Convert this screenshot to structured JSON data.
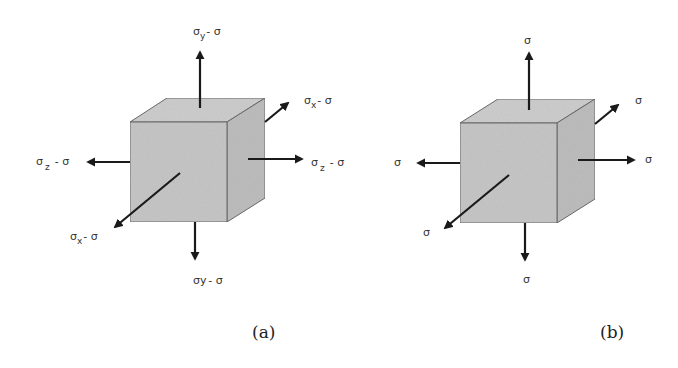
{
  "figure": {
    "colors": {
      "cube_fill": "#c4c4c4",
      "cube_top": "#cfcfcf",
      "cube_side": "#bdbdbd",
      "edge": "#666666",
      "arrow": "#1a1a1a",
      "text": "#333333"
    },
    "panel_a": {
      "caption": "(a)",
      "labels": {
        "top": {
          "base": "σ",
          "sub": "y",
          "rest": "- σ"
        },
        "back_right": {
          "base": "σ",
          "sub": "x",
          "rest": "- σ"
        },
        "left": {
          "base": "σ",
          "sub": "z",
          "rest": "- σ"
        },
        "right": {
          "base": "σ",
          "sub": "z",
          "rest": "- σ"
        },
        "front_left": {
          "base": "σ",
          "sub": "x",
          "rest": "- σ"
        },
        "bottom": {
          "base": "σy",
          "sub": "",
          "rest": "- σ"
        }
      }
    },
    "panel_b": {
      "caption": "(b)",
      "labels": {
        "top": "σ",
        "back_right": "σ",
        "left": "σ",
        "right": "σ",
        "front_left": "σ",
        "bottom": "σ"
      }
    }
  }
}
